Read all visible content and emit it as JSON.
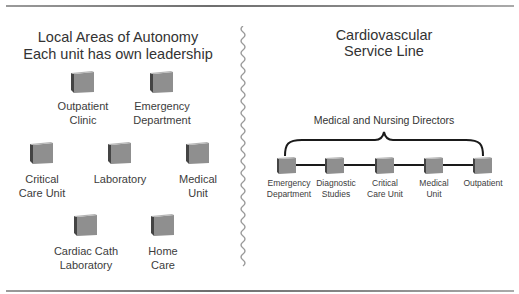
{
  "left": {
    "title_line1": "Local Areas of Autonomy",
    "title_line2": "Each unit has own leadership",
    "units": [
      {
        "line1": "Outpatient",
        "line2": "Clinic"
      },
      {
        "line1": "Emergency",
        "line2": "Department"
      },
      {
        "line1": "Critical",
        "line2": "Care Unit"
      },
      {
        "line1": "Laboratory",
        "line2": ""
      },
      {
        "line1": "Medical",
        "line2": "Unit"
      },
      {
        "line1": "Cardiac Cath",
        "line2": "Laboratory"
      },
      {
        "line1": "Home",
        "line2": "Care"
      }
    ]
  },
  "right": {
    "title_line1": "Cardiovascular",
    "title_line2": "Service Line",
    "brace_label": "Medical and Nursing Directors",
    "units": [
      {
        "line1": "Emergency",
        "line2": "Department"
      },
      {
        "line1": "Diagnostic",
        "line2": "Studies"
      },
      {
        "line1": "Critical",
        "line2": "Care Unit"
      },
      {
        "line1": "Medical",
        "line2": "Unit"
      },
      {
        "line1": "Outpatient",
        "line2": ""
      }
    ]
  },
  "colors": {
    "cube_front": "#8f8f8f",
    "cube_side": "#4a4a4a",
    "cube_top": "#b5b5b5",
    "divider": "#9a9a9a",
    "connector": "#1a1a1a"
  }
}
